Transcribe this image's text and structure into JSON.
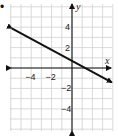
{
  "bullet": "•",
  "graph": {
    "x_axis_label": "x",
    "y_axis_label": "y",
    "x_ticks": [
      {
        "value": -4,
        "label": "−4"
      },
      {
        "value": -2,
        "label": "−2"
      }
    ],
    "y_ticks": [
      {
        "value": 4,
        "label": "4"
      },
      {
        "value": 2,
        "label": "2"
      },
      {
        "value": -2,
        "label": "−2"
      },
      {
        "value": -4,
        "label": "−4"
      }
    ],
    "xlim": [
      -6,
      4
    ],
    "ylim": [
      -6,
      6
    ],
    "grid": true,
    "line": {
      "slope": -0.5,
      "intercept": 0.5,
      "from": [
        -6,
        3.5
      ],
      "to": [
        4,
        -1.5
      ]
    },
    "colors": {
      "grid": "#d0d0d0",
      "axis": "#111111",
      "line": "#111111"
    }
  }
}
